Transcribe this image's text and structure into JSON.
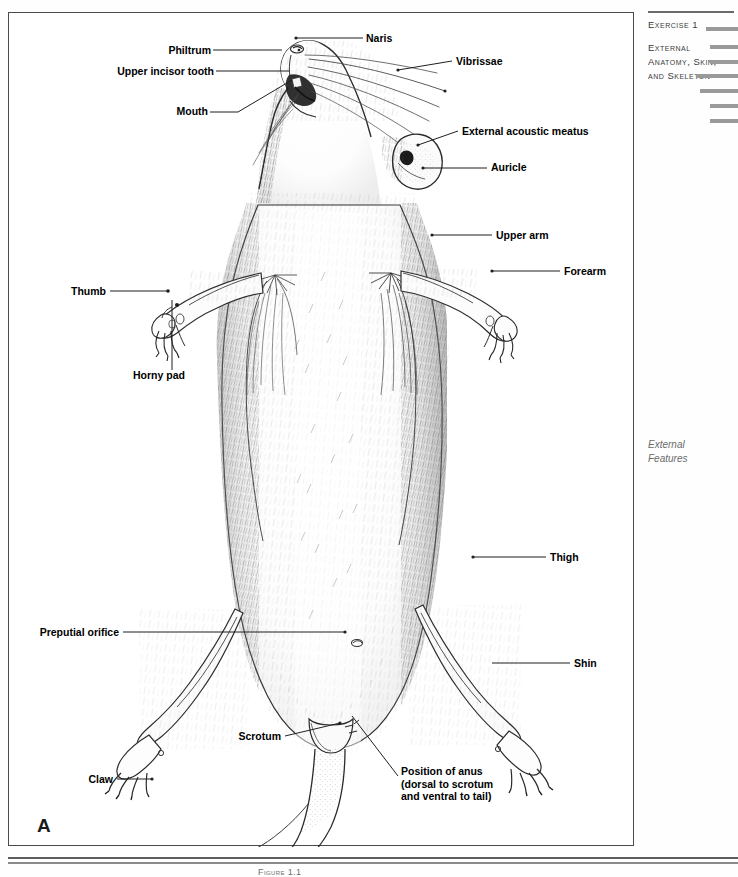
{
  "running_head": {
    "exercise_number": "Exercise 1",
    "title_line_1": "External",
    "title_line_2": "Anatomy, Skin,",
    "title_line_3": "and Skeleton",
    "section_note_line_1": "External",
    "section_note_line_2": "Features",
    "tab_color": "#9a9a9a"
  },
  "figure": {
    "panel_letter": "A",
    "caption_fragment": "Figure 1.1",
    "border_color": "#4a4a4a"
  },
  "labels": [
    {
      "id": "naris",
      "text": "Naris"
    },
    {
      "id": "philtrum",
      "text": "Philtrum"
    },
    {
      "id": "upper-incisor",
      "text": "Upper incisor tooth"
    },
    {
      "id": "mouth",
      "text": "Mouth"
    },
    {
      "id": "vibrissae",
      "text": "Vibrissae"
    },
    {
      "id": "external-acoustic-meatus",
      "text": "External acoustic meatus"
    },
    {
      "id": "auricle",
      "text": "Auricle"
    },
    {
      "id": "upper-arm",
      "text": "Upper arm"
    },
    {
      "id": "forearm",
      "text": "Forearm"
    },
    {
      "id": "thumb",
      "text": "Thumb"
    },
    {
      "id": "horny-pad",
      "text": "Horny pad"
    },
    {
      "id": "thigh",
      "text": "Thigh"
    },
    {
      "id": "shin",
      "text": "Shin"
    },
    {
      "id": "preputial-orifice",
      "text": "Preputial orifice"
    },
    {
      "id": "scrotum",
      "text": "Scrotum"
    },
    {
      "id": "claw",
      "text": "Claw"
    },
    {
      "id": "position-of-anus",
      "text": "Position of anus (dorsal to scrotum and ventral to tail)"
    }
  ]
}
